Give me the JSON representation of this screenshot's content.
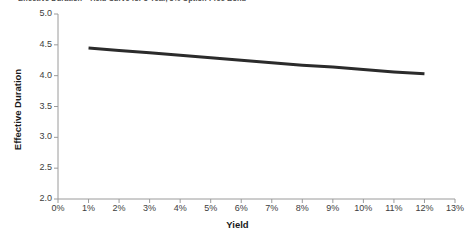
{
  "chart_data": {
    "type": "line",
    "title": "Effective Duration - Yield Curve for 5 Year, 5% Option-Free Bond",
    "xlabel": "Yield",
    "ylabel": "Effective Duration",
    "xtick_labels": [
      "0%",
      "1%",
      "2%",
      "3%",
      "4%",
      "5%",
      "6%",
      "7%",
      "8%",
      "9%",
      "10%",
      "11%",
      "12%",
      "13%"
    ],
    "xtick_values": [
      0,
      1,
      2,
      3,
      4,
      5,
      6,
      7,
      8,
      9,
      10,
      11,
      12,
      13
    ],
    "ytick_labels": [
      "2.0",
      "2.5",
      "3.0",
      "3.5",
      "4.0",
      "4.5",
      "5.0"
    ],
    "ytick_values": [
      2.0,
      2.5,
      3.0,
      3.5,
      4.0,
      4.5,
      5.0
    ],
    "xlim": [
      0,
      13
    ],
    "ylim": [
      2.0,
      5.0
    ],
    "grid": false,
    "legend": false,
    "line_color": "#2b2b2b",
    "axis_color": "#9a9a9a",
    "background": "#ffffff",
    "series": [
      {
        "name": "Effective Duration",
        "x": [
          1,
          2,
          3,
          4,
          5,
          6,
          7,
          8,
          9,
          10,
          11,
          12
        ],
        "values": [
          4.45,
          4.41,
          4.37,
          4.33,
          4.29,
          4.25,
          4.21,
          4.17,
          4.14,
          4.1,
          4.06,
          4.03
        ]
      }
    ]
  }
}
